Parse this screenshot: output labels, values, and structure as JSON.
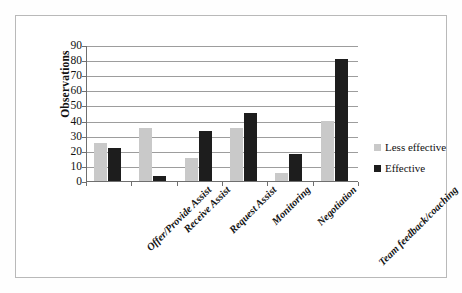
{
  "chart_data": {
    "type": "bar",
    "title": "",
    "xlabel": "",
    "ylabel": "Observations",
    "ylim": [
      0,
      90
    ],
    "ytick_step": 10,
    "yticks": [
      90,
      80,
      70,
      60,
      50,
      40,
      30,
      20,
      10,
      0
    ],
    "grid": true,
    "legend_position": "right",
    "categories": [
      "Offer/Provide  Assist",
      "Receive Assist",
      "Request Assist",
      "Monitoring",
      "Negotiation",
      "Team feedback/coaching"
    ],
    "series": [
      {
        "name": "Less effective",
        "color": "#c9c9c9",
        "values": [
          25,
          35,
          15,
          35,
          5,
          40
        ]
      },
      {
        "name": "Effective",
        "color": "#1d1d1d",
        "values": [
          22,
          3,
          33,
          45,
          18,
          81
        ]
      }
    ]
  },
  "legend": {
    "items": [
      {
        "label": "Less effective",
        "swatch": "#c9c9c9"
      },
      {
        "label": "Effective",
        "swatch": "#1d1d1d"
      }
    ]
  }
}
